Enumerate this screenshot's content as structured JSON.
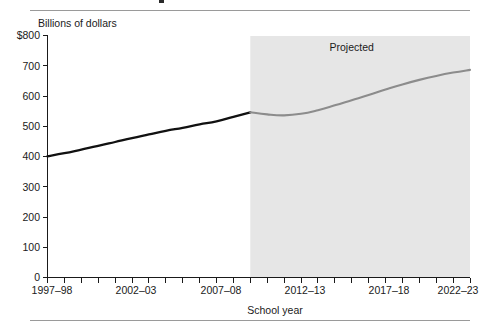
{
  "figure": {
    "top_rule": "divider",
    "bottom_rule": "divider"
  },
  "axes": {
    "y_unit_label": "Billions of dollars",
    "x_title": "School year",
    "y_ticks": [
      "$800",
      "700",
      "600",
      "500",
      "400",
      "300",
      "200",
      "100",
      "0"
    ],
    "x_ticks": [
      "1997–98",
      "2002–03",
      "2007–08",
      "2012–13",
      "2017–18",
      "2022–23"
    ]
  },
  "annotations": {
    "projected_label": "Projected"
  },
  "colors": {
    "actual_line": "#111111",
    "projected_line": "#8c8c8c",
    "projected_band": "#e6e6e6",
    "axis": "#1a1a1a",
    "rule": "#9a9a9a"
  },
  "chart_data": {
    "type": "line",
    "title": "",
    "subtitle": "",
    "xlabel": "School year",
    "ylabel": "Billions of dollars",
    "ylim": [
      0,
      800
    ],
    "ytick_values": [
      0,
      100,
      200,
      300,
      400,
      500,
      600,
      700,
      800
    ],
    "xlim": [
      "1997-98",
      "2022-23"
    ],
    "xtick_labels": [
      "1997–98",
      "2002–03",
      "2007–08",
      "2012–13",
      "2017–18",
      "2022–23"
    ],
    "grid": false,
    "legend": "none",
    "annotations": [
      {
        "text": "Projected",
        "x": "2015-16",
        "y": 760
      }
    ],
    "shaded_regions": [
      {
        "label": "Projected",
        "x_start": "2009-10",
        "x_end": "2022-23",
        "color": "#e6e6e6"
      }
    ],
    "x": [
      "1997-98",
      "1998-99",
      "1999-00",
      "2000-01",
      "2001-02",
      "2002-03",
      "2003-04",
      "2004-05",
      "2005-06",
      "2006-07",
      "2007-08",
      "2008-09",
      "2009-10",
      "2010-11",
      "2011-12",
      "2012-13",
      "2013-14",
      "2014-15",
      "2015-16",
      "2016-17",
      "2017-18",
      "2018-19",
      "2019-20",
      "2020-21",
      "2021-22",
      "2022-23"
    ],
    "series": [
      {
        "name": "Actual",
        "color": "#111111",
        "values": [
          400,
          410,
          422,
          434,
          447,
          460,
          472,
          484,
          494,
          505,
          515,
          530,
          545,
          null,
          null,
          null,
          null,
          null,
          null,
          null,
          null,
          null,
          null,
          null,
          null,
          null
        ]
      },
      {
        "name": "Projected",
        "color": "#8c8c8c",
        "values": [
          null,
          null,
          null,
          null,
          null,
          null,
          null,
          null,
          null,
          null,
          null,
          null,
          545,
          538,
          535,
          540,
          552,
          568,
          585,
          602,
          620,
          637,
          652,
          665,
          676,
          685
        ]
      }
    ]
  }
}
